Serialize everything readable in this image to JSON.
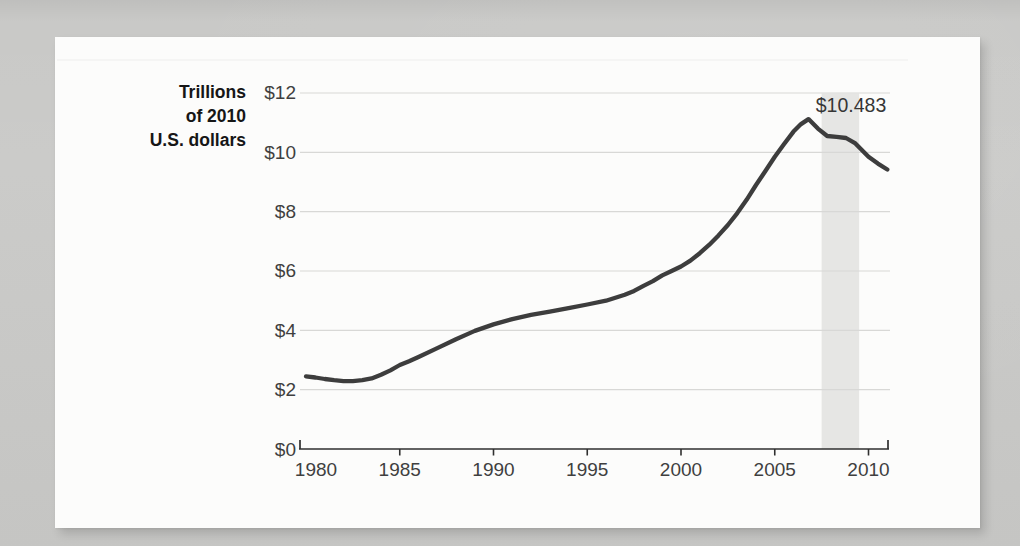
{
  "figure": {
    "unit_label_lines": [
      "Trillions",
      "of 2010",
      "U.S. dollars"
    ],
    "annotation_text": "$10.483"
  },
  "chart_data": {
    "type": "line",
    "title": "",
    "ylabel": "Trillions of 2010 U.S. dollars",
    "ylabel_lines": [
      "Trillions",
      "of 2010",
      "U.S. dollars"
    ],
    "xlabel": "",
    "xlim": [
      1979.6,
      2011.2
    ],
    "ylim": [
      0,
      12
    ],
    "grid": true,
    "legend": "none",
    "yticks": {
      "values": [
        0,
        2,
        4,
        6,
        8,
        10,
        12
      ],
      "labels": [
        "$0",
        "$2",
        "$4",
        "$6",
        "$8",
        "$10",
        "$12"
      ]
    },
    "xticks": {
      "values": [
        1980,
        1985,
        1990,
        1995,
        2000,
        2005,
        2010
      ],
      "labels": [
        "1980",
        "1985",
        "1990",
        "1995",
        "2000",
        "2005",
        "2010"
      ]
    },
    "shaded_band": {
      "from_year": 2007.5,
      "to_year": 2009.5
    },
    "annotation": {
      "text": "$10.483",
      "year": 2008.8,
      "value": 10.483
    },
    "series": [
      {
        "name": "value",
        "points": [
          [
            1980,
            2.45
          ],
          [
            1980.5,
            2.41
          ],
          [
            1981,
            2.36
          ],
          [
            1981.5,
            2.32
          ],
          [
            1982,
            2.29
          ],
          [
            1982.5,
            2.29
          ],
          [
            1983,
            2.32
          ],
          [
            1983.5,
            2.38
          ],
          [
            1984,
            2.5
          ],
          [
            1984.5,
            2.65
          ],
          [
            1985,
            2.83
          ],
          [
            1985.5,
            2.96
          ],
          [
            1986,
            3.1
          ],
          [
            1987,
            3.4
          ],
          [
            1988,
            3.7
          ],
          [
            1989,
            3.98
          ],
          [
            1990,
            4.2
          ],
          [
            1991,
            4.38
          ],
          [
            1992,
            4.52
          ],
          [
            1993,
            4.63
          ],
          [
            1994,
            4.75
          ],
          [
            1995,
            4.87
          ],
          [
            1996,
            5.0
          ],
          [
            1997,
            5.2
          ],
          [
            1997.5,
            5.33
          ],
          [
            1998,
            5.5
          ],
          [
            1998.5,
            5.66
          ],
          [
            1999,
            5.85
          ],
          [
            1999.5,
            6.0
          ],
          [
            2000,
            6.15
          ],
          [
            2000.5,
            6.35
          ],
          [
            2001,
            6.6
          ],
          [
            2001.5,
            6.88
          ],
          [
            2002,
            7.2
          ],
          [
            2002.5,
            7.55
          ],
          [
            2003,
            7.95
          ],
          [
            2003.5,
            8.4
          ],
          [
            2004,
            8.9
          ],
          [
            2004.5,
            9.37
          ],
          [
            2005,
            9.85
          ],
          [
            2005.5,
            10.28
          ],
          [
            2006,
            10.7
          ],
          [
            2006.4,
            10.95
          ],
          [
            2006.8,
            11.12
          ],
          [
            2007.3,
            10.8
          ],
          [
            2007.8,
            10.55
          ],
          [
            2008.3,
            10.52
          ],
          [
            2008.8,
            10.483
          ],
          [
            2009.3,
            10.3
          ],
          [
            2010,
            9.85
          ],
          [
            2010.5,
            9.62
          ],
          [
            2011,
            9.42
          ]
        ]
      }
    ],
    "colors": {
      "line": "#3d3d3d",
      "grid": "#d8d8d6",
      "band": "#e6e6e4",
      "axis": "#2f2f2f",
      "tick_text": "#3f3f3f",
      "unit_label_text": "#161616",
      "annotation_text": "#363636",
      "card_background": "#fcfcfb",
      "page_background": "#c9c9c7"
    }
  }
}
